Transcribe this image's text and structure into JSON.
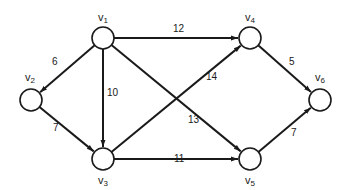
{
  "diagram": {
    "type": "directed-weighted-graph",
    "colors": {
      "stroke": "#1a1a1a",
      "node_fill": "#ffffff",
      "background": "#ffffff"
    },
    "nodes": [
      {
        "id": "v1",
        "base": "v",
        "sub": "1",
        "x": 103,
        "y": 38,
        "lx": 98,
        "ly": 12
      },
      {
        "id": "v2",
        "base": "v",
        "sub": "2",
        "x": 31,
        "y": 100,
        "lx": 25,
        "ly": 72
      },
      {
        "id": "v3",
        "base": "v",
        "sub": "3",
        "x": 103,
        "y": 159,
        "lx": 98,
        "ly": 175
      },
      {
        "id": "v4",
        "base": "v",
        "sub": "4",
        "x": 250,
        "y": 38,
        "lx": 245,
        "ly": 12
      },
      {
        "id": "v5",
        "base": "v",
        "sub": "5",
        "x": 250,
        "y": 159,
        "lx": 245,
        "ly": 175
      },
      {
        "id": "v6",
        "base": "v",
        "sub": "6",
        "x": 320,
        "y": 100,
        "lx": 315,
        "ly": 72
      }
    ],
    "edges": [
      {
        "from": "v1",
        "to": "v2",
        "weight": "6",
        "lx": 52,
        "ly": 62
      },
      {
        "from": "v1",
        "to": "v3",
        "weight": "10",
        "lx": 107,
        "ly": 93
      },
      {
        "from": "v1",
        "to": "v4",
        "weight": "12",
        "lx": 173,
        "ly": 29
      },
      {
        "from": "v1",
        "to": "v5",
        "weight": "13",
        "lx": 188,
        "ly": 120
      },
      {
        "from": "v2",
        "to": "v3",
        "weight": "7",
        "lx": 53,
        "ly": 128
      },
      {
        "from": "v3",
        "to": "v4",
        "weight": "14",
        "lx": 206,
        "ly": 77
      },
      {
        "from": "v3",
        "to": "v5",
        "weight": "11",
        "lx": 174,
        "ly": 159
      },
      {
        "from": "v4",
        "to": "v6",
        "weight": "5",
        "lx": 289,
        "ly": 62
      },
      {
        "from": "v5",
        "to": "v6",
        "weight": "7",
        "lx": 291,
        "ly": 133
      }
    ]
  }
}
